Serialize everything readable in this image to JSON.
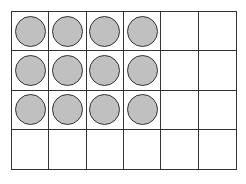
{
  "frame": {
    "rows": 4,
    "columns": 6,
    "line_color": "#333333",
    "counter_fill": "#c0c0c0",
    "counter_stroke": "#333333",
    "filled": [
      [
        true,
        true,
        true,
        true,
        false,
        false
      ],
      [
        true,
        true,
        true,
        true,
        false,
        false
      ],
      [
        true,
        true,
        true,
        true,
        false,
        false
      ],
      [
        false,
        false,
        false,
        false,
        false,
        false
      ]
    ],
    "total_counters": 12,
    "total_cells": 24
  }
}
